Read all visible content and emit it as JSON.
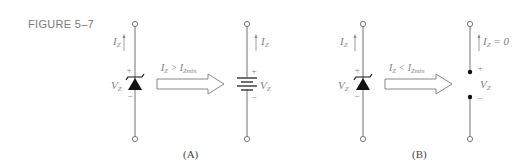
{
  "figure": {
    "label": "FIGURE 5–7"
  },
  "panels": [
    {
      "caption": "(A)",
      "left_component": {
        "type": "zener-diode",
        "current_label": "I",
        "current_sub": "Z",
        "voltage_label": "V",
        "voltage_sub": "Z",
        "plus": "+",
        "minus": "−"
      },
      "condition": {
        "lhs": "I",
        "lhs_sub": "Z",
        "op": " > ",
        "rhs": "I",
        "rhs_sub": "Zmin"
      },
      "right_component": {
        "type": "battery",
        "current_label": "I",
        "current_sub": "Z",
        "voltage_label": "V",
        "voltage_sub": "Z",
        "plus": "+",
        "minus": "−"
      }
    },
    {
      "caption": "(B)",
      "left_component": {
        "type": "zener-diode",
        "current_label": "I",
        "current_sub": "Z",
        "voltage_label": "V",
        "voltage_sub": "Z",
        "plus": "+",
        "minus": "−"
      },
      "condition": {
        "lhs": "I",
        "lhs_sub": "Z",
        "op": " < ",
        "rhs": "I",
        "rhs_sub": "Zmin"
      },
      "right_component": {
        "type": "open-circuit",
        "current_label": "I",
        "current_sub": "Z",
        "current_value": " = 0",
        "voltage_label": "V",
        "voltage_sub": "Z",
        "plus": "+",
        "minus": "−"
      }
    }
  ],
  "colors": {
    "wire": "#8a8a8a",
    "diode": "#111111",
    "text": "#808080"
  }
}
